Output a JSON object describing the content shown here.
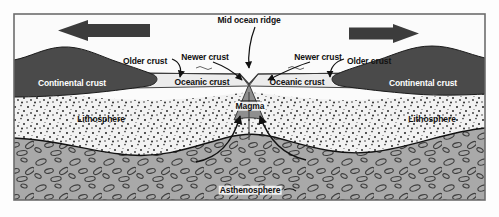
{
  "diagram": {
    "type": "geological-cross-section",
    "frame": {
      "x": 14,
      "y": 14,
      "width": 471,
      "height": 186
    },
    "colors": {
      "continental_crust": "#4a4a4a",
      "oceanic_crust": "#e9e9e9",
      "lithosphere": "#f0f0f0",
      "asthenosphere": "#a8a8a8",
      "magma_plume": "#8f8f8f",
      "arrow": "#3c3c3c",
      "outline": "#1a1a1a",
      "label_text": "#111111",
      "label_text_on_dark": "#ffffff"
    },
    "labels": {
      "mid_ocean_ridge": "Mid ocean ridge",
      "newer_crust_left": "Newer crust",
      "newer_crust_right": "Newer crust",
      "older_crust_left": "Older crust",
      "older_crust_right": "Older crust",
      "oceanic_crust_left": "Oceanic crust",
      "oceanic_crust_right": "Oceanic crust",
      "continental_crust_left": "Continental crust",
      "continental_crust_right": "Continental crust",
      "lithosphere_left": "Lithosphere",
      "lithosphere_right": "Lithosphere",
      "asthenosphere": "Asthenosphere",
      "magma": "Magma"
    },
    "label_positions": {
      "mid_ocean_ridge": {
        "x": 249,
        "y": 20,
        "anchor": "center"
      },
      "newer_crust_left": {
        "x": 205,
        "y": 57,
        "anchor": "center"
      },
      "newer_crust_right": {
        "x": 318,
        "y": 57,
        "anchor": "center"
      },
      "older_crust_left": {
        "x": 145,
        "y": 61,
        "anchor": "center"
      },
      "older_crust_right": {
        "x": 369,
        "y": 61,
        "anchor": "center"
      },
      "oceanic_crust_left": {
        "x": 202,
        "y": 82,
        "anchor": "center"
      },
      "oceanic_crust_right": {
        "x": 297,
        "y": 82,
        "anchor": "center"
      },
      "continental_crust_left": {
        "x": 72,
        "y": 83,
        "anchor": "center"
      },
      "continental_crust_right": {
        "x": 423,
        "y": 83,
        "anchor": "center"
      },
      "lithosphere_left": {
        "x": 101,
        "y": 119,
        "anchor": "center"
      },
      "lithosphere_right": {
        "x": 432,
        "y": 119,
        "anchor": "center"
      },
      "asthenosphere": {
        "x": 250,
        "y": 190,
        "anchor": "center"
      },
      "magma": {
        "x": 250,
        "y": 106,
        "anchor": "center"
      }
    },
    "spreading_arrows": [
      {
        "name": "left-spreading-arrow",
        "direction": "left",
        "x": 58,
        "y": 20,
        "width": 92,
        "height": 21
      },
      {
        "name": "right-spreading-arrow",
        "direction": "right",
        "x": 349,
        "y": 24,
        "width": 70,
        "height": 19
      }
    ],
    "layers": [
      {
        "name": "oceanic-crust",
        "description": "thin light band of new sea floor either side of the ridge"
      },
      {
        "name": "continental-crust",
        "description": "dark wedge-shaped continental blocks at both margins"
      },
      {
        "name": "lithosphere",
        "description": "stippled rigid layer beneath the crust"
      },
      {
        "name": "asthenosphere",
        "description": "grey layer with elongated oval inclusions, flows by convection"
      },
      {
        "name": "magma-plume",
        "description": "upwelling magma column beneath the mid ocean ridge"
      }
    ],
    "convection_arrows": [
      {
        "name": "left-convection-arrow",
        "description": "curved arrow rising from asthenosphere to magma"
      },
      {
        "name": "right-convection-arrow",
        "description": "curved arrow rising from asthenosphere to magma"
      }
    ]
  }
}
